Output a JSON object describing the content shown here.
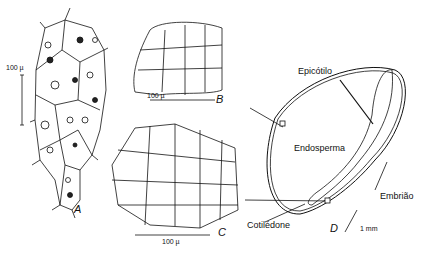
{
  "figure": {
    "panels": {
      "A": {
        "letter": "A",
        "scale": "100 µ"
      },
      "B": {
        "letter": "B",
        "scale": "100 µ"
      },
      "C": {
        "letter": "C",
        "scale": "100 µ"
      },
      "D": {
        "letter": "D",
        "scale": "1 mm",
        "labels": {
          "epicotyl": "Epicótilo",
          "endosperm": "Endosperma",
          "embryo": "Embrião",
          "cotyledon": "Cotilédone"
        }
      }
    }
  }
}
